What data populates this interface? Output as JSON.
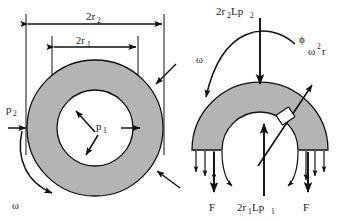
{
  "figure": {
    "colors": {
      "ring_fill": "#b4b4b4",
      "stroke": "#000000",
      "element_fill": "#ffffff",
      "background": "#ffffff"
    }
  },
  "left_diagram": {
    "name": "full-ring-cross-section",
    "dimensions": [
      {
        "id": "outer",
        "label": "2r",
        "sub": "2",
        "description": "outer diameter"
      },
      {
        "id": "inner",
        "label": "2r",
        "sub": "1",
        "description": "inner diameter"
      }
    ],
    "pressures": [
      {
        "id": "external",
        "label": "p",
        "sub": "2",
        "direction": "inward",
        "arrow_count": 3
      },
      {
        "id": "internal",
        "label": "p",
        "sub": "1",
        "direction": "outward",
        "arrow_count": 3
      }
    ],
    "rotation": {
      "label": "ω",
      "description": "angular velocity",
      "direction": "clockwise"
    }
  },
  "right_diagram": {
    "name": "half-ring-free-body-diagram",
    "top_force": {
      "label": "2r",
      "sub": "2",
      "label2": "Lp",
      "sub2": "2",
      "direction": "down"
    },
    "bottom_force": {
      "label": "2r",
      "sub": "1",
      "label2": "Lp",
      "sub2": "1",
      "direction": "up"
    },
    "angle": {
      "label": "ϕ",
      "description": "angular position"
    },
    "acceleration": {
      "label": "ω",
      "sup": "2",
      "label2": "r",
      "description": "centripetal acceleration"
    },
    "rotation": {
      "label": "ω",
      "description": "angular velocity",
      "direction": "clockwise"
    },
    "reactions": [
      {
        "id": "left",
        "label": "F",
        "direction": "down"
      },
      {
        "id": "right",
        "label": "F",
        "direction": "down"
      }
    ],
    "distributed_arrows_per_side": 4
  }
}
